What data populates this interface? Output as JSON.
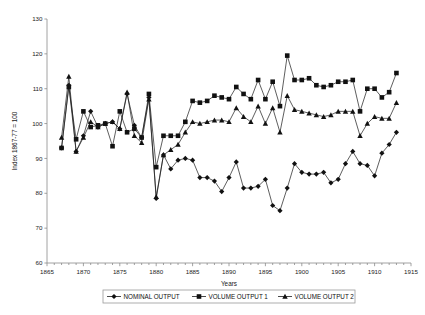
{
  "chart_data": {
    "type": "line",
    "title": "",
    "xlabel": "Years",
    "ylabel": "Index 1867-77 = 100",
    "xlim": [
      1865,
      1915
    ],
    "ylim": [
      60,
      130
    ],
    "xticks": [
      1865,
      1870,
      1875,
      1880,
      1885,
      1890,
      1895,
      1900,
      1905,
      1910,
      1915
    ],
    "xtick_labels": [
      "1865",
      "1870",
      "1875",
      "1880",
      "1885",
      "1890",
      "1895",
      "1900",
      "1905",
      "1910",
      "1915"
    ],
    "xtick_step_minor": 1,
    "yticks": [
      60,
      70,
      80,
      90,
      100,
      110,
      120,
      130
    ],
    "ytick_labels": [
      "60",
      "70",
      "80",
      "90",
      "100",
      "110",
      "120",
      "130"
    ],
    "grid": false,
    "legend_position": "bottom",
    "x": [
      1867,
      1868,
      1869,
      1870,
      1871,
      1872,
      1873,
      1874,
      1875,
      1876,
      1877,
      1878,
      1879,
      1880,
      1881,
      1882,
      1883,
      1884,
      1885,
      1886,
      1887,
      1888,
      1889,
      1890,
      1891,
      1892,
      1893,
      1894,
      1895,
      1896,
      1897,
      1898,
      1899,
      1900,
      1901,
      1902,
      1903,
      1904,
      1905,
      1906,
      1907,
      1908,
      1909,
      1910,
      1911,
      1912,
      1913
    ],
    "series": [
      {
        "name": "NOMINAL OUTPUT",
        "marker": "diamond",
        "values": [
          93.0,
          111.0,
          92.0,
          96.5,
          103.5,
          99.0,
          100.0,
          100.5,
          98.5,
          108.5,
          99.5,
          96.0,
          107.5,
          78.5,
          91.0,
          87.0,
          89.5,
          90.0,
          89.5,
          84.5,
          84.5,
          83.5,
          80.5,
          84.5,
          89.0,
          81.5,
          81.5,
          82.0,
          84.0,
          76.5,
          75.0,
          81.5,
          88.5,
          86.0,
          85.5,
          85.5,
          86.0,
          83.0,
          84.0,
          88.5,
          92.0,
          88.5,
          88.0,
          85.0,
          91.5,
          94.0,
          97.5
        ]
      },
      {
        "name": "VOLUME OUTPUT 1",
        "marker": "square",
        "values": [
          93.0,
          110.5,
          95.5,
          103.5,
          99.0,
          99.5,
          100.0,
          93.5,
          103.5,
          97.5,
          98.5,
          96.0,
          108.5,
          87.5,
          96.5,
          96.5,
          96.5,
          100.5,
          106.5,
          106.0,
          106.5,
          108.0,
          107.5,
          107.0,
          110.5,
          108.5,
          107.0,
          112.5,
          107.0,
          112.0,
          105.0,
          119.5,
          112.5,
          112.5,
          113.0,
          111.0,
          110.5,
          111.0,
          112.0,
          112.0,
          112.5,
          103.5,
          110.0,
          110.0,
          107.5,
          109.0,
          114.5
        ]
      },
      {
        "name": "VOLUME OUTPUT 2",
        "marker": "triangle",
        "values": [
          96.0,
          113.5,
          92.0,
          96.0,
          100.5,
          99.0,
          100.0,
          100.5,
          98.5,
          109.0,
          96.5,
          94.5,
          107.0,
          79.0,
          91.0,
          92.5,
          94.0,
          97.5,
          100.5,
          100.0,
          100.5,
          101.0,
          101.0,
          100.5,
          104.5,
          102.0,
          100.5,
          105.0,
          100.0,
          104.5,
          97.5,
          108.0,
          104.0,
          103.5,
          103.0,
          102.5,
          102.0,
          102.5,
          103.5,
          103.5,
          103.5,
          96.5,
          100.0,
          102.0,
          101.5,
          101.5,
          106.0
        ]
      }
    ]
  },
  "legend": {
    "items": [
      {
        "label": "NOMINAL OUTPUT",
        "marker": "diamond"
      },
      {
        "label": "VOLUME OUTPUT 1",
        "marker": "square"
      },
      {
        "label": "VOLUME OUTPUT 2",
        "marker": "triangle"
      }
    ]
  },
  "colors": {
    "ink": "#111111",
    "axis": "#8a8a8a",
    "background": "#ffffff"
  }
}
